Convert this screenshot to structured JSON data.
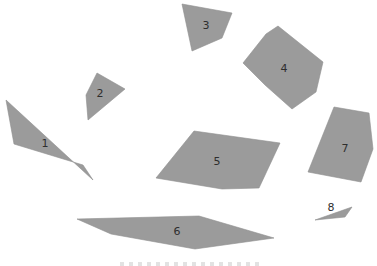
{
  "diagram": {
    "type": "numbered-polygons",
    "fill_color": "#9b9b9b",
    "label_color": "#2e2e2e",
    "background_color": "#ffffff",
    "shapes": [
      {
        "id": "1",
        "label": "1"
      },
      {
        "id": "2",
        "label": "2"
      },
      {
        "id": "3",
        "label": "3"
      },
      {
        "id": "4",
        "label": "4"
      },
      {
        "id": "5",
        "label": "5"
      },
      {
        "id": "6",
        "label": "6"
      },
      {
        "id": "7",
        "label": "7"
      },
      {
        "id": "8",
        "label": "8"
      }
    ]
  }
}
